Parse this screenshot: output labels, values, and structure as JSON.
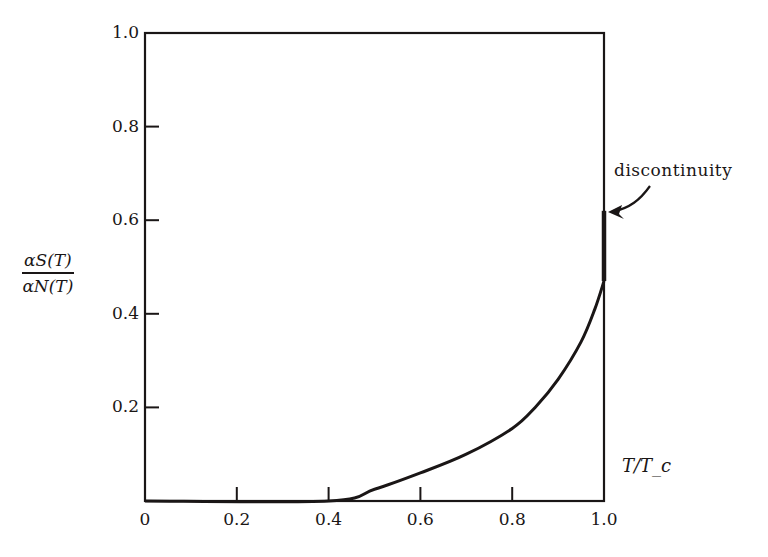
{
  "chart_data": {
    "type": "line",
    "title": "",
    "xlabel": "T/T_c",
    "ylabel": "α_S(T) / α_N(T)",
    "ylabel_numerator": "αS(T)",
    "ylabel_denominator": "αN(T)",
    "xlim": [
      0,
      1.0
    ],
    "ylim": [
      0,
      1.0
    ],
    "x_ticks": [
      "0",
      "0.2",
      "0.4",
      "0.6",
      "0.8",
      "1.0"
    ],
    "y_ticks": [
      "0.2",
      "0.4",
      "0.6",
      "0.8",
      "1.0"
    ],
    "grid": false,
    "legend": null,
    "series": [
      {
        "name": "alpha_S/alpha_N",
        "x": [
          0.0,
          0.4,
          0.5,
          0.6,
          0.7,
          0.8,
          0.85,
          0.9,
          0.95,
          0.98,
          1.0
        ],
        "y": [
          0.0,
          0.0,
          0.025,
          0.06,
          0.1,
          0.155,
          0.2,
          0.26,
          0.34,
          0.41,
          0.47
        ]
      },
      {
        "name": "discontinuity",
        "x": [
          1.0,
          1.0
        ],
        "y": [
          0.47,
          0.62
        ]
      }
    ],
    "annotations": [
      {
        "text": "discontinuity",
        "x": 1.0,
        "y": 0.62,
        "arrow": true
      }
    ],
    "colors": {
      "line": "#1a1616",
      "background": "#ffffff"
    }
  }
}
